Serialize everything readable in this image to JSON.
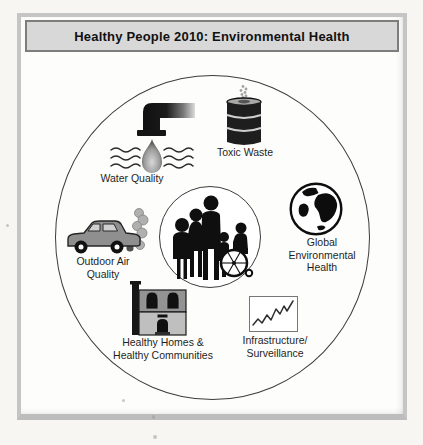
{
  "window": {
    "title": "Healthy People 2010: Environmental Health"
  },
  "diagram": {
    "center": {
      "icon": "people-group-icon",
      "meaning": "community of people including person in wheelchair"
    },
    "nodes": [
      {
        "id": "water-quality",
        "icon": "faucet-water-icon",
        "lines": [
          "Water Quality"
        ]
      },
      {
        "id": "toxic-waste",
        "icon": "waste-barrel-icon",
        "lines": [
          "Toxic Waste"
        ]
      },
      {
        "id": "global-environmental-health",
        "icon": "globe-icon",
        "lines": [
          "Global",
          "Environmental",
          "Health"
        ]
      },
      {
        "id": "outdoor-air-quality",
        "icon": "car-exhaust-icon",
        "lines": [
          "Outdoor Air",
          "Quality"
        ]
      },
      {
        "id": "healthy-homes-healthy-communities",
        "icon": "house-icon",
        "lines": [
          "Healthy Homes &",
          "Healthy Communities"
        ]
      },
      {
        "id": "infrastructure-surveillance",
        "icon": "trend-chart-icon",
        "lines": [
          "Infrastructure/",
          "Surveillance"
        ]
      }
    ]
  },
  "colors": {
    "title_bar_bg": "#d8d8d8",
    "title_bar_border": "#7d7d7d",
    "frame_border": "#c5c5c5",
    "circle_line": "#3c3c3c",
    "silhouette": "#0f0f0f",
    "page_bg": "#f7f6f3"
  }
}
